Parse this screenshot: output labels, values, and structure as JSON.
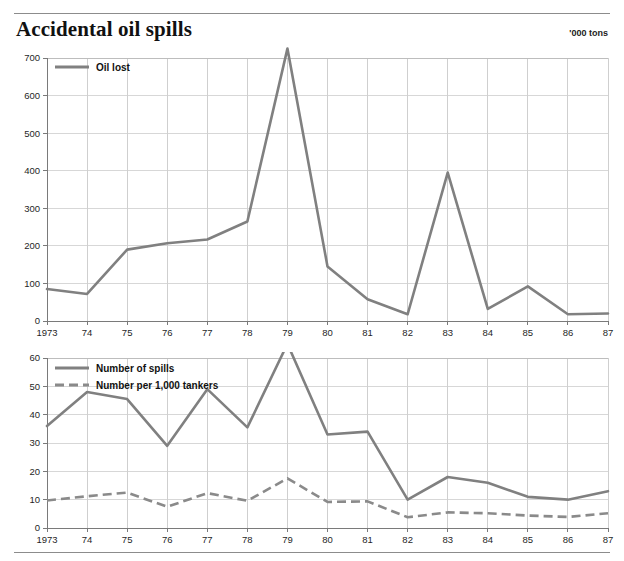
{
  "header": {
    "title": "Accidental oil spills",
    "units_note": "'000 tons"
  },
  "chart_data": [
    {
      "id": "oil-lost",
      "type": "line",
      "title": "Accidental oil spills",
      "subtitle": "'000 tons",
      "xlabel": "",
      "ylabel": "",
      "grid": true,
      "legend_position": "top-left",
      "categories": [
        "1973",
        "74",
        "75",
        "76",
        "77",
        "78",
        "79",
        "80",
        "81",
        "82",
        "83",
        "84",
        "85",
        "86",
        "87"
      ],
      "x": [
        1973,
        1974,
        1975,
        1976,
        1977,
        1978,
        1979,
        1980,
        1981,
        1982,
        1983,
        1984,
        1985,
        1986,
        1987
      ],
      "ylim": [
        0,
        700
      ],
      "yticks": [
        0,
        100,
        200,
        300,
        400,
        500,
        600,
        700
      ],
      "ytick_labels": [
        "0",
        "100",
        "200",
        "300",
        "400",
        "500",
        "600",
        "700"
      ],
      "series": [
        {
          "name": "Oil lost",
          "style": "solid",
          "color": "#808080",
          "values": [
            85,
            72,
            190,
            207,
            217,
            265,
            725,
            145,
            58,
            18,
            395,
            32,
            92,
            18,
            20
          ]
        }
      ]
    },
    {
      "id": "number-of-spills",
      "type": "line",
      "title": "",
      "xlabel": "",
      "ylabel": "",
      "grid": true,
      "legend_position": "top-left",
      "categories": [
        "1973",
        "74",
        "75",
        "76",
        "77",
        "78",
        "79",
        "80",
        "81",
        "82",
        "83",
        "84",
        "85",
        "86",
        "87"
      ],
      "x": [
        1973,
        1974,
        1975,
        1976,
        1977,
        1978,
        1979,
        1980,
        1981,
        1982,
        1983,
        1984,
        1985,
        1986,
        1987
      ],
      "ylim": [
        0,
        60
      ],
      "yticks": [
        0,
        10,
        20,
        30,
        40,
        50,
        60
      ],
      "ytick_labels": [
        "0",
        "10",
        "20",
        "30",
        "40",
        "50",
        "60"
      ],
      "series": [
        {
          "name": "Number of spills",
          "style": "solid",
          "color": "#808080",
          "values": [
            36,
            48,
            45.5,
            29,
            49,
            35.5,
            65,
            33,
            34,
            10,
            18,
            16,
            11,
            10,
            13
          ]
        },
        {
          "name": "Number per 1,000 tankers",
          "style": "dashed",
          "color": "#8a8a8a",
          "values": [
            9.7,
            11.2,
            12.5,
            7.5,
            12.3,
            9.6,
            17.5,
            9.2,
            9.4,
            3.8,
            5.5,
            5.2,
            4.4,
            3.9,
            5.2
          ]
        }
      ]
    }
  ],
  "chart_top": {
    "legend": [
      {
        "label": "Oil lost",
        "style": "solid"
      }
    ],
    "y_labels": [
      "700",
      "600",
      "500",
      "400",
      "300",
      "200",
      "100",
      "0"
    ],
    "x_labels": [
      "1973",
      "74",
      "75",
      "76",
      "77",
      "78",
      "79",
      "80",
      "81",
      "82",
      "83",
      "84",
      "85",
      "86",
      "87"
    ]
  },
  "chart_bottom": {
    "legend": [
      {
        "label": "Number of spills",
        "style": "solid"
      },
      {
        "label": "Number per 1,000 tankers",
        "style": "dashed"
      }
    ],
    "y_labels": [
      "60",
      "50",
      "40",
      "30",
      "20",
      "10",
      "0"
    ],
    "x_labels": [
      "1973",
      "74",
      "75",
      "76",
      "77",
      "78",
      "79",
      "80",
      "81",
      "82",
      "83",
      "84",
      "85",
      "86",
      "87"
    ]
  },
  "colors": {
    "series_solid": "#808080",
    "series_dashed": "#8a8a8a",
    "grid": "#d7d7d7",
    "axis": "#7a7a7a",
    "text": "#1a1a1a"
  }
}
